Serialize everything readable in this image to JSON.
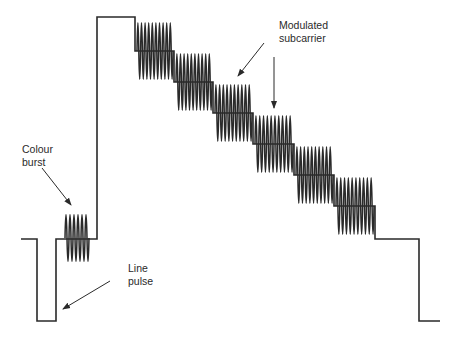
{
  "diagram": {
    "labels": {
      "colour_burst": [
        "Colour",
        "burst"
      ],
      "line_pulse": [
        "Line",
        "pulse"
      ],
      "modulated_subcarrier": [
        "Modulated",
        "subcarrier"
      ]
    },
    "colors": {
      "stroke": "#2a2a2a",
      "background": "#ffffff"
    },
    "levels": {
      "blanking_y": 239,
      "sync_y": 321,
      "white_y": 17
    },
    "steps": [
      {
        "x0": 135,
        "x1": 174,
        "cy": 51
      },
      {
        "x0": 174,
        "x1": 213,
        "cy": 82
      },
      {
        "x0": 213,
        "x1": 253,
        "cy": 113
      },
      {
        "x0": 253,
        "x1": 294,
        "cy": 144
      },
      {
        "x0": 294,
        "x1": 334,
        "cy": 175
      },
      {
        "x0": 334,
        "x1": 375,
        "cy": 206
      }
    ],
    "step_amplitude": 29,
    "burst": {
      "x0": 65,
      "x1": 89,
      "cy": 238,
      "amp": 24
    }
  }
}
